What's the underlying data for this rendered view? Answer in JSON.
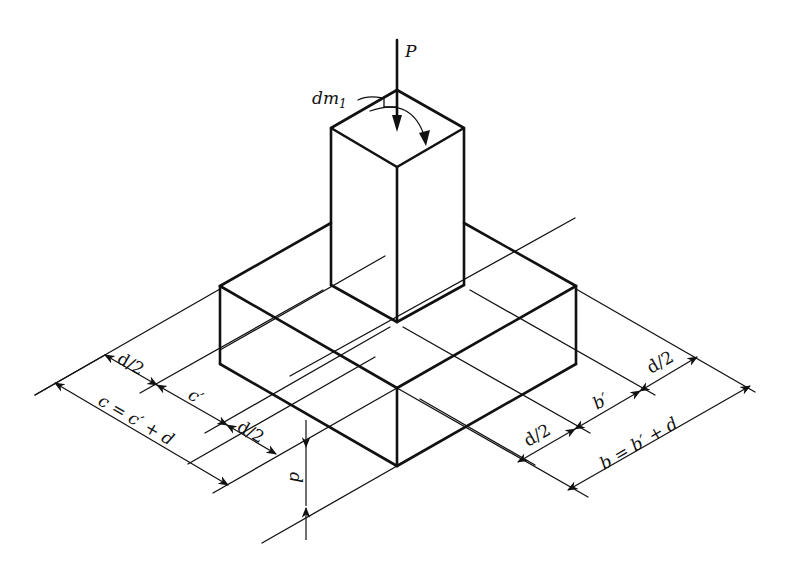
{
  "figure": {
    "type": "isometric footing with column",
    "labels": {
      "load": "P",
      "moment": "dm",
      "moment_subscript": "1",
      "left_half_d_outer": "d/2",
      "left_column_width": "c′",
      "left_half_d_inner": "d/2",
      "left_total": "c = c′ + d",
      "depth": "d",
      "right_half_d_inner": "d/2",
      "right_column_width": "b′",
      "right_half_d_outer": "d/2",
      "right_total": "b = b′ + d"
    },
    "caption": ""
  },
  "colors": {
    "ink": "#111111",
    "background": "#ffffff"
  }
}
